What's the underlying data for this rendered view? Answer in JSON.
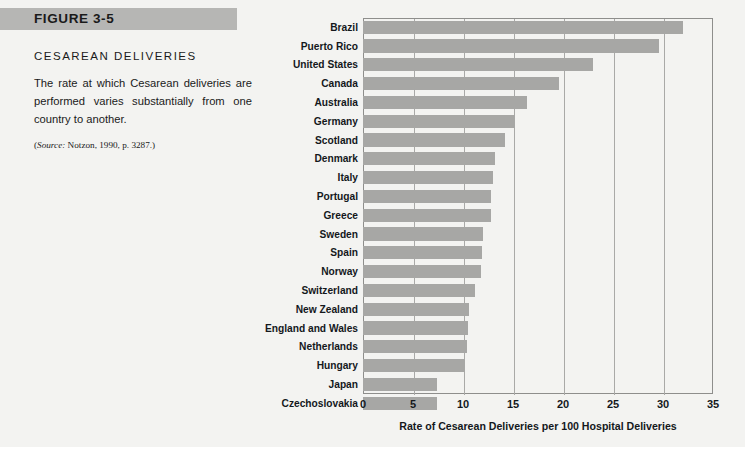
{
  "figure": {
    "banner_label": "FIGURE 3-5",
    "title": "CESAREAN DELIVERIES",
    "body": "The rate at which Cesarean deliveries are performed varies substantially from one country to another.",
    "source_prefix": "Source:",
    "source_rest": " Notzon, 1990, p. 3287.",
    "source_open": "(",
    "source_close": ")"
  },
  "colors": {
    "banner": "#b6b6b4",
    "bar": "#a7a7a5",
    "page": "#f3f3f1",
    "gridline": "#a9a9a7",
    "text": "#14181c"
  },
  "chart_data": {
    "type": "bar",
    "orientation": "horizontal",
    "title": "CESAREAN DELIVERIES",
    "xlabel": "Rate of Cesarean Deliveries per 100 Hospital Deliveries",
    "ylabel": "",
    "xlim": [
      0,
      35
    ],
    "xticks": [
      0,
      5,
      10,
      15,
      20,
      25,
      30,
      35
    ],
    "xtick_labels": [
      "0",
      "5",
      "10",
      "15",
      "20",
      "25",
      "30",
      "35"
    ],
    "grid": true,
    "legend": false,
    "categories": [
      "Brazil",
      "Puerto Rico",
      "United States",
      "Canada",
      "Australia",
      "Germany",
      "Scotland",
      "Denmark",
      "Italy",
      "Portugal",
      "Greece",
      "Sweden",
      "Spain",
      "Norway",
      "Switzerland",
      "New Zealand",
      "England and Wales",
      "Netherlands",
      "Hungary",
      "Japan",
      "Czechoslovakia"
    ],
    "values": [
      32.0,
      29.6,
      23.0,
      19.6,
      16.4,
      15.2,
      14.2,
      13.2,
      13.0,
      12.8,
      12.8,
      12.0,
      11.9,
      11.8,
      11.2,
      10.6,
      10.5,
      10.4,
      10.2,
      7.4,
      7.4
    ]
  }
}
